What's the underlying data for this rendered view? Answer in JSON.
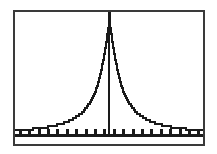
{
  "screen": {
    "kind": "graphing-calculator-plot",
    "frame_color": "#3a3a3a",
    "background_color": "#ffffff",
    "curve_color": "#1a1a1a",
    "axis_color": "#1a1a1a",
    "title": "",
    "label": ""
  },
  "chart_data": {
    "type": "line",
    "title": "",
    "subtitle": "",
    "xlabel": "",
    "ylabel": "",
    "grid": false,
    "legend": null,
    "legend_position": "none",
    "xlim": [
      -10,
      10
    ],
    "ylim": [
      0,
      1
    ],
    "x_ticks": [
      -9.5,
      -8.5,
      -7.5,
      -6.5,
      -5.5,
      -4.5,
      -3.5,
      -2.5,
      -1.5,
      -0.5,
      0.5,
      1.5,
      2.5,
      3.5,
      4.5,
      5.5,
      6.5,
      7.5,
      8.5,
      9.5
    ],
    "x_tick_labels": [],
    "y_ticks": [],
    "y_tick_labels": [],
    "y_axis_line_x": 0,
    "x_axis_line_y": 0,
    "annotations": [],
    "series": [
      {
        "name": "peaked curve",
        "description": "symmetric single-peak bell/Cauchy-like curve centered at x=0, peak clipped at top of window, long flat tails",
        "x": [
          -10,
          -9.5,
          -9,
          -8.5,
          -8,
          -7.5,
          -7,
          -6.5,
          -6,
          -5.5,
          -5,
          -4.5,
          -4,
          -3.5,
          -3,
          -2.5,
          -2,
          -1.75,
          -1.5,
          -1.25,
          -1,
          -0.85,
          -0.7,
          -0.55,
          -0.4,
          -0.3,
          -0.2,
          -0.12,
          -0.06,
          0,
          0.06,
          0.12,
          0.2,
          0.3,
          0.4,
          0.55,
          0.7,
          0.85,
          1,
          1.25,
          1.5,
          1.75,
          2,
          2.5,
          3,
          3.5,
          4,
          4.5,
          5,
          5.5,
          6,
          6.5,
          7,
          7.5,
          8,
          8.5,
          9,
          9.5,
          10
        ],
        "y": [
          0.038,
          0.04,
          0.043,
          0.046,
          0.05,
          0.054,
          0.059,
          0.065,
          0.073,
          0.082,
          0.093,
          0.107,
          0.125,
          0.147,
          0.176,
          0.216,
          0.272,
          0.31,
          0.355,
          0.412,
          0.482,
          0.533,
          0.59,
          0.652,
          0.72,
          0.77,
          0.822,
          0.865,
          0.905,
          1.0,
          0.905,
          0.865,
          0.822,
          0.77,
          0.72,
          0.652,
          0.59,
          0.533,
          0.482,
          0.412,
          0.355,
          0.31,
          0.272,
          0.216,
          0.176,
          0.147,
          0.125,
          0.107,
          0.093,
          0.082,
          0.073,
          0.065,
          0.059,
          0.054,
          0.05,
          0.046,
          0.043,
          0.04,
          0.038
        ]
      }
    ]
  }
}
